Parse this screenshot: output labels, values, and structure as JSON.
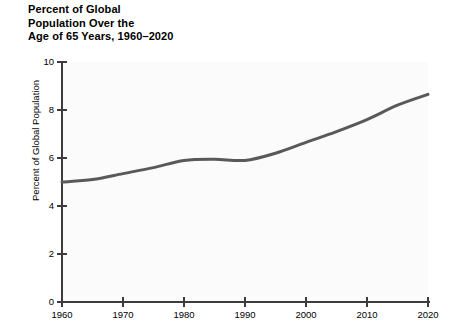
{
  "chart_data": {
    "type": "line",
    "title": "Percent of Global\nPopulation Over the\nAge of 65 Years, 1960–2020",
    "xlabel": "",
    "ylabel": "Percent of Global Population",
    "xlim": [
      1960,
      2020
    ],
    "ylim": [
      0,
      10
    ],
    "grid": false,
    "legend": false,
    "xticks": [
      "1960",
      "1970",
      "1980",
      "1990",
      "2000",
      "2010",
      "2020"
    ],
    "xtick_values": [
      1960,
      1970,
      1980,
      1990,
      2000,
      2010,
      2020
    ],
    "yticks": [
      "0",
      "2",
      "4",
      "6",
      "8",
      "10"
    ],
    "ytick_values": [
      0,
      2,
      4,
      6,
      8,
      10
    ],
    "line_color": "#595959",
    "line_width": 3,
    "plot_background": "#fbfbfb",
    "series": [
      {
        "name": "Percent of global population over age 65",
        "x": [
          1960,
          1965,
          1970,
          1975,
          1980,
          1985,
          1990,
          1995,
          2000,
          2005,
          2010,
          2015,
          2020
        ],
        "values": [
          5.0,
          5.1,
          5.35,
          5.6,
          5.9,
          5.95,
          5.9,
          6.2,
          6.65,
          7.1,
          7.6,
          8.2,
          8.65
        ]
      }
    ]
  },
  "axis": {
    "y_title": "Percent of Global Population"
  }
}
